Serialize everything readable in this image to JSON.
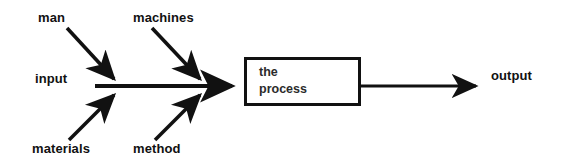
{
  "diagram": {
    "type": "input-process-output",
    "background_color": "#ffffff",
    "line_color": "#111111",
    "canvas": {
      "width": 565,
      "height": 168
    },
    "labels": {
      "man": "man",
      "machines": "machines",
      "input": "input",
      "materials": "materials",
      "method": "method",
      "output": "output"
    },
    "process_box": {
      "text": "the\nprocess",
      "line1": "the",
      "line2": "process",
      "border_color": "#111111",
      "fill_color": "#ffffff"
    },
    "arrows": [
      {
        "name": "man-arrow",
        "from_label": "man",
        "direction": "down-right",
        "target": "junction-1"
      },
      {
        "name": "materials-arrow",
        "from_label": "materials",
        "direction": "up-right",
        "target": "junction-1"
      },
      {
        "name": "machines-arrow",
        "from_label": "machines",
        "direction": "down-right",
        "target": "junction-2"
      },
      {
        "name": "method-arrow",
        "from_label": "method",
        "direction": "up-right",
        "target": "junction-2"
      },
      {
        "name": "input-arrow",
        "from_label": "input",
        "direction": "right",
        "target": "process-box"
      },
      {
        "name": "output-arrow",
        "from_label": "process",
        "direction": "right",
        "target": "output"
      }
    ]
  }
}
